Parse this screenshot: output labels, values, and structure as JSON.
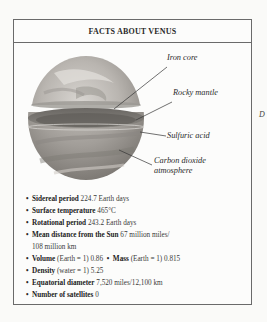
{
  "factbox": {
    "title": "FACTS ABOUT VENUS",
    "illustration": {
      "subject": "Venus cutaway",
      "labels": {
        "iron_core": "Iron core",
        "rocky_mantle": "Rocky mantle",
        "sulfuric_acid": "Sulfuric acid",
        "co2_line1": "Carbon dioxide",
        "co2_line2": "atmosphere"
      }
    },
    "facts": [
      {
        "label": "Sidereal period",
        "value": "224.7 Earth days"
      },
      {
        "label": "Surface temperature",
        "value": "465°C"
      },
      {
        "label": "Rotational period",
        "value": "243.2 Earth days"
      },
      {
        "label": "Mean distance from the Sun",
        "value": "67 million miles/",
        "value_cont": "108 million km"
      },
      {
        "label": "Volume",
        "value": "(Earth = 1) 0.86",
        "label2": "Mass",
        "value2": "(Earth = 1) 0.815"
      },
      {
        "label": "Density",
        "value": "(water = 1) 5.25"
      },
      {
        "label": "Equatorial diameter",
        "value": "7,520 miles/12,100 km"
      },
      {
        "label": "Number of satellites",
        "value": "0"
      }
    ],
    "bullet": "•"
  },
  "edge_text": "D"
}
